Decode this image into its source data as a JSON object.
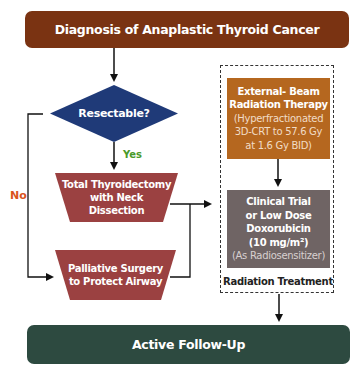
{
  "title": "Diagnosis of Anaplastic Thyroid Cancer",
  "decision": {
    "label": "Resectable?",
    "yes_label": "Yes",
    "no_label": "No"
  },
  "surgery": {
    "total": [
      "Total Thyroidectomy",
      "with Neck",
      "Dissection"
    ],
    "palliative": [
      "Palliative Surgery",
      "to Protect Airway"
    ]
  },
  "radiation_treatment": {
    "group_label": "Radiation Treatment",
    "ebrt": {
      "title": [
        "External- Beam",
        "Radiation Therapy"
      ],
      "detail": [
        "(Hyperfractionated",
        "3D-CRT to 57.6 Gy",
        "at 1.6 Gy BID)"
      ]
    },
    "chemo": {
      "title": [
        "Clinical Trial",
        "or Low Dose",
        "Doxorubicin",
        "(10 mg/m²)"
      ],
      "detail": [
        "(As Radiosensitizer)"
      ]
    }
  },
  "followup": "Active Follow-Up",
  "colors": {
    "title_banner": "#7a3312",
    "decision": "#1f3a78",
    "surgery": "#9b4141",
    "ebrt": "#b5671f",
    "chemo": "#6f6464",
    "followup": "#2d4a40",
    "yes": "#4a9a2a",
    "no": "#d9541c"
  }
}
